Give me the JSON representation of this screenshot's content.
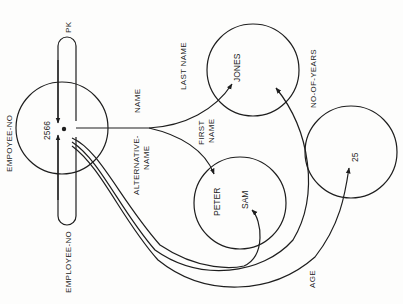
{
  "diagram": {
    "nodes": {
      "employee": {
        "value": "2566",
        "label_left": "EMPOYEE-NO"
      },
      "last_name": {
        "value": "JONES"
      },
      "first_name": {
        "values": [
          "PETER",
          "SAM"
        ]
      },
      "age": {
        "value": "25"
      }
    },
    "edges": {
      "pk": "PK",
      "employee_no": "EMPLOYEE-NO",
      "name": "NAME",
      "alternative_name_1": "ALTERNATIVE-",
      "alternative_name_2": "NAME",
      "last_name": "LAST NAME",
      "first_name_1": "FIRST",
      "first_name_2": "NAME",
      "no_of_years": "NO-OF-YEARS",
      "age": "AGE"
    },
    "colors": {
      "ink": "#1e1e1e",
      "paper": "#fdfdfc"
    }
  }
}
